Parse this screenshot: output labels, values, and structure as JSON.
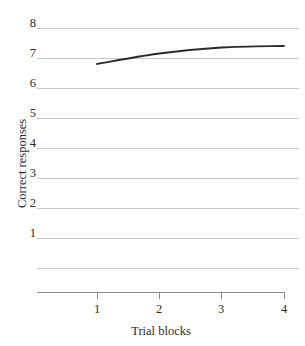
{
  "chart_data": {
    "type": "line",
    "title": "",
    "xlabel": "Trial blocks",
    "ylabel": "Correct responses",
    "x": [
      1,
      2,
      3,
      4
    ],
    "series": [
      {
        "name": "Correct responses",
        "values": [
          6.8,
          7.15,
          7.35,
          7.4
        ],
        "color": "#2b2b2b"
      }
    ],
    "xlim": [
      0.35,
      4.1
    ],
    "ylim": [
      0,
      8
    ],
    "xticks": [
      1,
      2,
      3,
      4
    ],
    "xtick_labels": [
      "1",
      "2",
      "3",
      "4"
    ],
    "yticks": [
      1,
      2,
      3,
      4,
      5,
      6,
      7,
      8
    ],
    "ytick_labels": [
      "1",
      "2",
      "3",
      "4",
      "5",
      "6",
      "7",
      "8"
    ],
    "grid": "horizontal",
    "gridlines_at": [
      0,
      1,
      2,
      3,
      4,
      5,
      6,
      7,
      8
    ],
    "legend": "none",
    "legend_position": "",
    "annotations": []
  },
  "axes": {
    "y_title": "Correct responses",
    "x_title": "Trial blocks",
    "y_labels": [
      "8",
      "7",
      "6",
      "5",
      "4",
      "3",
      "2",
      "1"
    ],
    "x_labels": [
      "1",
      "2",
      "3",
      "4"
    ]
  },
  "colors": {
    "gridline": "#c9c9c9",
    "axis": "#8d8d8d",
    "curve": "#2b2b2b",
    "text": "#2b2b2b",
    "background": "#ffffff"
  }
}
